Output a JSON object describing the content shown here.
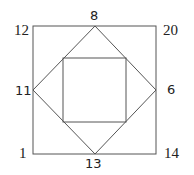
{
  "diagram": {
    "shapes": {
      "outer_square": {
        "x1": 33,
        "y1": 26,
        "x2": 156,
        "y2": 154
      },
      "diamond": "midpoints of outer square",
      "inner_square": {
        "x1": 63,
        "y1": 58,
        "x2": 126,
        "y2": 122
      }
    },
    "labels": {
      "top_left": "12",
      "top_right": "20",
      "bottom_left": "1",
      "bottom_right": "14",
      "top_mid": "8",
      "right_mid": "6",
      "bottom_mid": "13",
      "left_mid": "11"
    },
    "colors": {
      "line": "#555555",
      "text": "#222222"
    }
  }
}
